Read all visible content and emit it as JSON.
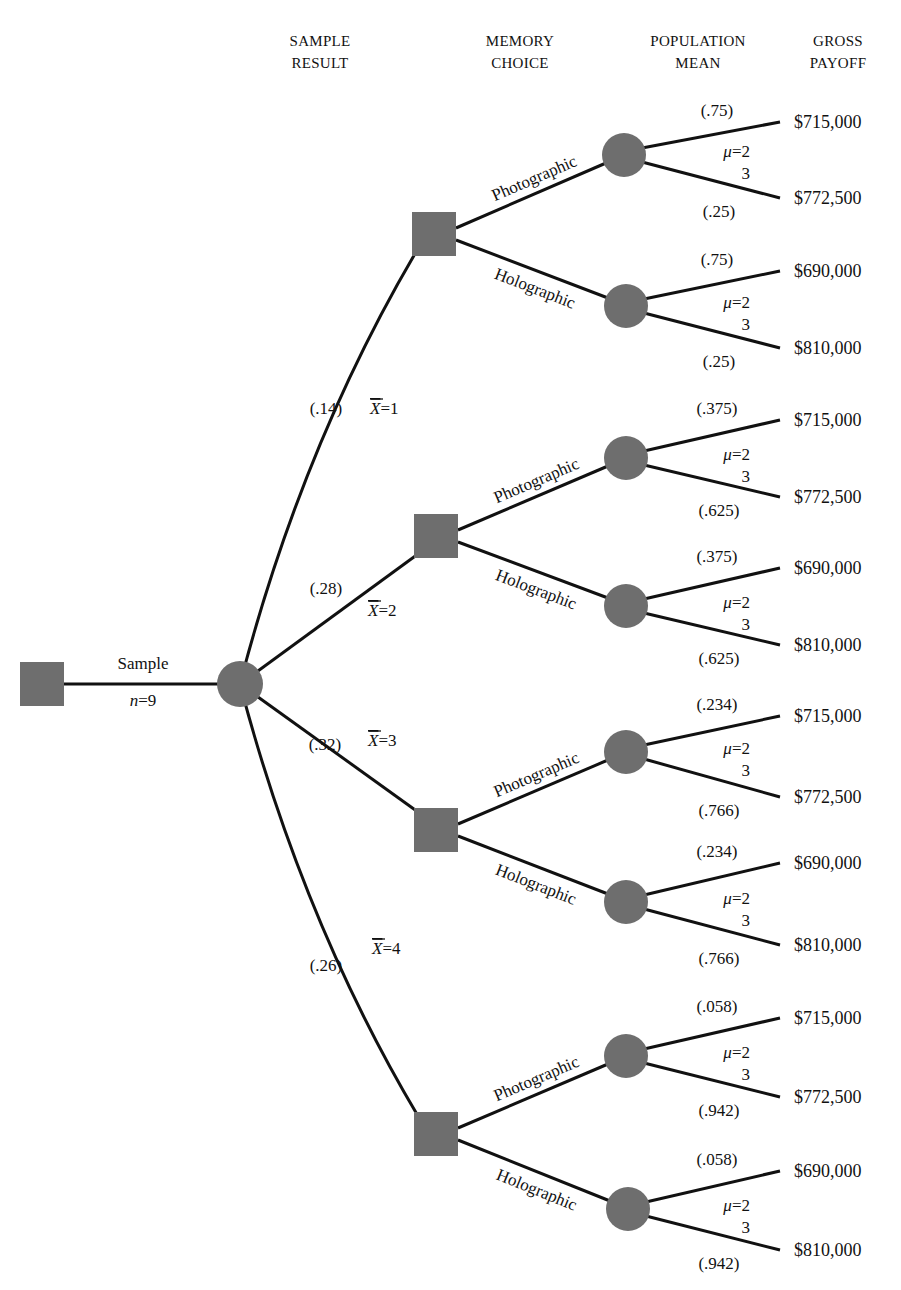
{
  "column_headers": [
    {
      "id": "sample-result",
      "line1": "SAMPLE",
      "line2": "RESULT",
      "x": 320,
      "y": 30
    },
    {
      "id": "memory-choice",
      "line1": "MEMORY",
      "line2": "CHOICE",
      "x": 520,
      "y": 30
    },
    {
      "id": "population-mean",
      "line1": "POPULATION",
      "line2": "MEAN",
      "x": 698,
      "y": 30
    },
    {
      "id": "gross-payoff",
      "line1": "GROSS",
      "line2": "PAYOFF",
      "x": 838,
      "y": 30
    }
  ],
  "root": {
    "decision_node": {
      "x": 42,
      "y": 684,
      "size": 44
    },
    "branch_label_top": "Sample",
    "branch_label_bottom": "n=9",
    "chance_node": {
      "x": 240,
      "y": 684,
      "r": 23
    }
  },
  "sample_results": [
    {
      "xbar_label": "X̄=1",
      "xbar": 1,
      "probability": "(.14)",
      "prob_pos": [
        326,
        414
      ],
      "xbar_pos": [
        370,
        414
      ],
      "node": {
        "x": 434,
        "y": 234
      },
      "choices": [
        {
          "label": "Photographic",
          "chance": {
            "x": 624,
            "y": 155
          },
          "upper_prob": "(.75)",
          "lower_prob": "(.25)",
          "mu_top": "μ=2",
          "mu_bottom": "3",
          "upper_payoff": "$715,000",
          "lower_payoff": "$772,500",
          "upper_end": [
            780,
            122
          ],
          "lower_end": [
            780,
            198
          ]
        },
        {
          "label": "Holographic",
          "chance": {
            "x": 626,
            "y": 306
          },
          "upper_prob": "(.75)",
          "lower_prob": "(.25)",
          "mu_top": "μ=2",
          "mu_bottom": "3",
          "upper_payoff": "$690,000",
          "lower_payoff": "$810,000",
          "upper_end": [
            780,
            271
          ],
          "lower_end": [
            780,
            348
          ]
        }
      ]
    },
    {
      "xbar_label": "X̄=2",
      "xbar": 2,
      "probability": "(.28)",
      "prob_pos": [
        326,
        594
      ],
      "xbar_pos": [
        368,
        616
      ],
      "node": {
        "x": 436,
        "y": 536
      },
      "choices": [
        {
          "label": "Photographic",
          "chance": {
            "x": 626,
            "y": 458
          },
          "upper_prob": "(.375)",
          "lower_prob": "(.625)",
          "mu_top": "μ=2",
          "mu_bottom": "3",
          "upper_payoff": "$715,000",
          "lower_payoff": "$772,500",
          "upper_end": [
            780,
            420
          ],
          "lower_end": [
            780,
            497
          ]
        },
        {
          "label": "Holographic",
          "chance": {
            "x": 626,
            "y": 606
          },
          "upper_prob": "(.375)",
          "lower_prob": "(.625)",
          "mu_top": "μ=2",
          "mu_bottom": "3",
          "upper_payoff": "$690,000",
          "lower_payoff": "$810,000",
          "upper_end": [
            780,
            568
          ],
          "lower_end": [
            780,
            645
          ]
        }
      ]
    },
    {
      "xbar_label": "X̄=3",
      "xbar": 3,
      "probability": "(.32)",
      "prob_pos": [
        325,
        750
      ],
      "xbar_pos": [
        368,
        746
      ],
      "node": {
        "x": 436,
        "y": 830
      },
      "choices": [
        {
          "label": "Photographic",
          "chance": {
            "x": 626,
            "y": 752
          },
          "upper_prob": "(.234)",
          "lower_prob": "(.766)",
          "mu_top": "μ=2",
          "mu_bottom": "3",
          "upper_payoff": "$715,000",
          "lower_payoff": "$772,500",
          "upper_end": [
            780,
            716
          ],
          "lower_end": [
            780,
            797
          ]
        },
        {
          "label": "Holographic",
          "chance": {
            "x": 626,
            "y": 902
          },
          "upper_prob": "(.234)",
          "lower_prob": "(.766)",
          "mu_top": "μ=2",
          "mu_bottom": "3",
          "upper_payoff": "$690,000",
          "lower_payoff": "$810,000",
          "upper_end": [
            780,
            863
          ],
          "lower_end": [
            780,
            945
          ]
        }
      ]
    },
    {
      "xbar_label": "X̄=4",
      "xbar": 4,
      "probability": "(.26)",
      "prob_pos": [
        326,
        971
      ],
      "xbar_pos": [
        372,
        954
      ],
      "node": {
        "x": 436,
        "y": 1134
      },
      "choices": [
        {
          "label": "Photographic",
          "chance": {
            "x": 626,
            "y": 1056
          },
          "upper_prob": "(.058)",
          "lower_prob": "(.942)",
          "mu_top": "μ=2",
          "mu_bottom": "3",
          "upper_payoff": "$715,000",
          "lower_payoff": "$772,500",
          "upper_end": [
            780,
            1018
          ],
          "lower_end": [
            780,
            1097
          ]
        },
        {
          "label": "Holographic",
          "chance": {
            "x": 628,
            "y": 1209
          },
          "upper_prob": "(.058)",
          "lower_prob": "(.942)",
          "mu_top": "μ=2",
          "mu_bottom": "3",
          "upper_payoff": "$690,000",
          "lower_payoff": "$810,000",
          "upper_end": [
            780,
            1171
          ],
          "lower_end": [
            780,
            1250
          ]
        }
      ]
    }
  ],
  "style": {
    "node_fill": "#6e6e6e",
    "edge_color": "#111111",
    "text_color": "#111111",
    "background": "#ffffff"
  }
}
